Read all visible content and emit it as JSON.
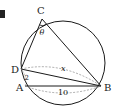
{
  "figure": {
    "marker": "■",
    "points": {
      "C": {
        "label": "C",
        "x": 42,
        "y": 19
      },
      "D": {
        "label": "D",
        "x": 21,
        "y": 69
      },
      "A": {
        "label": "A",
        "x": 25,
        "y": 86
      },
      "B": {
        "label": "B",
        "x": 101,
        "y": 86
      }
    },
    "circle": {
      "cx": 63,
      "cy": 63,
      "r": 42
    },
    "angle_label": "θ",
    "segments": {
      "DA": "2",
      "DB": "x",
      "AB": "10"
    },
    "colors": {
      "stroke": "#1a1a1a",
      "dashed": "#888888",
      "marker": "#222222"
    }
  }
}
